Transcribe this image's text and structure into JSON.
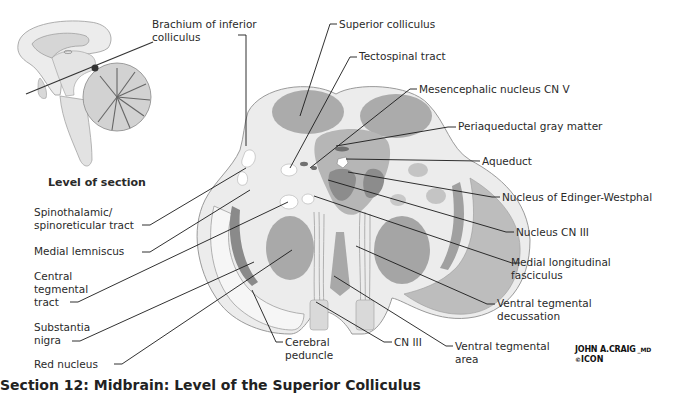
{
  "figure": {
    "inset_label": "Level of section",
    "caption": "Section 12: Midbrain: Level of the Superior Colliculus",
    "signature": {
      "artist": "JOHN A.CRAIG",
      "suffix": "MD",
      "copyright": "©",
      "publisher": "ICON"
    },
    "colors": {
      "background": "#ffffff",
      "tissue_light": "#ececec",
      "tissue_mid": "#b3b3b3",
      "tissue_dark": "#8e8e8e",
      "leader_line": "#1a1a1a"
    }
  },
  "labels": {
    "left": [
      {
        "id": "spinothalamic",
        "text": [
          "Spinothalamic/",
          "spinoreticular tract"
        ]
      },
      {
        "id": "medial_lemniscus",
        "text": [
          "Medial lemniscus"
        ]
      },
      {
        "id": "central_tegmental",
        "text": [
          "Central",
          "tegmental",
          "tract"
        ]
      },
      {
        "id": "substantia_nigra",
        "text": [
          "Substantia",
          "nigra"
        ]
      },
      {
        "id": "red_nucleus",
        "text": [
          "Red nucleus"
        ]
      }
    ],
    "top": [
      {
        "id": "brachium",
        "text": [
          "Brachium of inferior",
          "colliculus"
        ]
      },
      {
        "id": "superior_colliculus",
        "text": [
          "Superior colliculus"
        ]
      },
      {
        "id": "tectospinal",
        "text": [
          "Tectospinal tract"
        ]
      },
      {
        "id": "mesencephalic",
        "text": [
          "Mesencephalic nucleus CN V"
        ]
      }
    ],
    "right": [
      {
        "id": "periaqueductal",
        "text": [
          "Periaqueductal gray matter"
        ]
      },
      {
        "id": "aqueduct",
        "text": [
          "Aqueduct"
        ]
      },
      {
        "id": "edinger",
        "text": [
          "Nucleus of Edinger-Westphal"
        ]
      },
      {
        "id": "cn3_nucleus",
        "text": [
          "Nucleus CN III"
        ]
      },
      {
        "id": "mlf",
        "text": [
          "Medial longitudinal",
          "fasciculus"
        ]
      },
      {
        "id": "vtd",
        "text": [
          "Ventral tegmental",
          "decussation"
        ]
      },
      {
        "id": "vta",
        "text": [
          "Ventral tegmental",
          "area"
        ]
      }
    ],
    "bottom": [
      {
        "id": "cerebral_peduncle",
        "text": [
          "Cerebral",
          "peduncle"
        ]
      },
      {
        "id": "cn3",
        "text": [
          "CN III"
        ]
      }
    ]
  }
}
